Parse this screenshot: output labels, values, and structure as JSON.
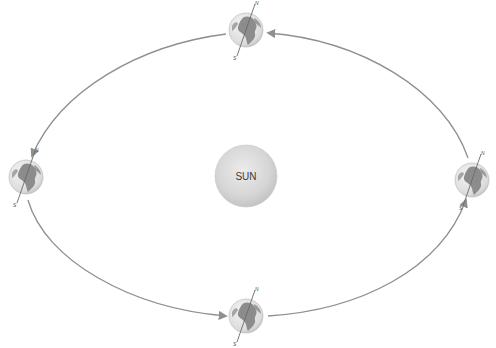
{
  "diagram": {
    "title": "",
    "sun": {
      "label": "SUN",
      "cx": 246,
      "cy": 176,
      "r": 31,
      "color": "#d4d4d4"
    },
    "orbit": {
      "color": "#8f8f8f",
      "direction": "counter-clockwise"
    },
    "earth_positions": [
      {
        "name": "top",
        "cx": 246,
        "cy": 30,
        "north_label": "N",
        "south_label": "S"
      },
      {
        "name": "left",
        "cx": 26,
        "cy": 177,
        "north_label": "N",
        "south_label": "S"
      },
      {
        "name": "right",
        "cx": 472,
        "cy": 180,
        "north_label": "N",
        "south_label": "S"
      },
      {
        "name": "bottom",
        "cx": 246,
        "cy": 316,
        "north_label": "N",
        "south_label": "S"
      }
    ],
    "colors": {
      "ocean": "#e6e6e6",
      "land": "#8c8c8c",
      "axis": "#6a6a6a",
      "background": "#ffffff"
    }
  }
}
